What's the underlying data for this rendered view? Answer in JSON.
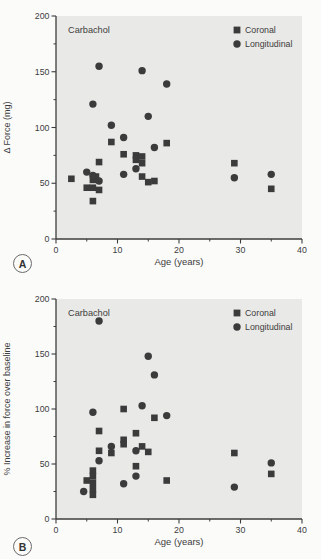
{
  "panels": [
    {
      "tag": "A"
    },
    {
      "tag": "B"
    }
  ],
  "colors": {
    "plot_bg": "#e9e9e7",
    "marker": "#3b3b3b",
    "axis": "#3d3d3d",
    "text": "#3d3d3d"
  },
  "chart_data": [
    {
      "type": "scatter",
      "title": "",
      "annotation": "Carbachol",
      "xlabel": "Age (years)",
      "ylabel": "Δ Force (mg)",
      "xlim": [
        0,
        40
      ],
      "ylim": [
        0,
        200
      ],
      "x_ticks": [
        0,
        10,
        20,
        30,
        40
      ],
      "x_minor_ticks": [
        5,
        15,
        25,
        35
      ],
      "y_ticks": [
        0,
        50,
        100,
        150,
        200
      ],
      "y_minor_ticks": [
        25,
        75,
        125,
        175
      ],
      "grid": false,
      "legend_position": "top-right",
      "series": [
        {
          "name": "Coronal",
          "marker": "square",
          "points": [
            [
              2.5,
              54
            ],
            [
              5,
              46
            ],
            [
              6,
              53
            ],
            [
              6,
              46
            ],
            [
              6,
              34
            ],
            [
              6.5,
              56
            ],
            [
              7,
              44
            ],
            [
              7,
              69
            ],
            [
              9,
              87
            ],
            [
              11,
              76
            ],
            [
              13,
              71
            ],
            [
              13,
              75
            ],
            [
              14,
              74
            ],
            [
              14,
              68
            ],
            [
              14,
              56
            ],
            [
              15,
              51
            ],
            [
              16,
              52
            ],
            [
              18,
              86
            ],
            [
              29,
              68
            ],
            [
              35,
              45
            ]
          ]
        },
        {
          "name": "Longitudinal",
          "marker": "circle",
          "points": [
            [
              5,
              60
            ],
            [
              6,
              57
            ],
            [
              6,
              121
            ],
            [
              7,
              155
            ],
            [
              7,
              52
            ],
            [
              9,
              102
            ],
            [
              11,
              91
            ],
            [
              11,
              58
            ],
            [
              13,
              63
            ],
            [
              14,
              151
            ],
            [
              15,
              110
            ],
            [
              16,
              82
            ],
            [
              18,
              139
            ],
            [
              29,
              55
            ],
            [
              35,
              58
            ]
          ]
        }
      ]
    },
    {
      "type": "scatter",
      "title": "",
      "annotation": "Carbachol",
      "xlabel": "Age (years)",
      "ylabel": "% Increase in force over baseline",
      "xlim": [
        0,
        40
      ],
      "ylim": [
        0,
        200
      ],
      "x_ticks": [
        0,
        10,
        20,
        30,
        40
      ],
      "x_minor_ticks": [
        5,
        15,
        25,
        35
      ],
      "y_ticks": [
        0,
        50,
        100,
        150,
        200
      ],
      "y_minor_ticks": [
        25,
        75,
        125,
        175
      ],
      "grid": false,
      "legend_position": "top-right",
      "series": [
        {
          "name": "Coronal",
          "marker": "square",
          "points": [
            [
              5,
              35
            ],
            [
              6,
              44
            ],
            [
              6,
              39
            ],
            [
              6,
              33
            ],
            [
              6,
              27
            ],
            [
              6,
              22
            ],
            [
              7,
              80
            ],
            [
              7,
              62
            ],
            [
              9,
              60
            ],
            [
              11,
              100
            ],
            [
              11,
              72
            ],
            [
              11,
              68
            ],
            [
              13,
              78
            ],
            [
              13,
              48
            ],
            [
              14,
              66
            ],
            [
              15,
              61
            ],
            [
              16,
              92
            ],
            [
              18,
              35
            ],
            [
              29,
              60
            ],
            [
              35,
              41
            ]
          ]
        },
        {
          "name": "Longitudinal",
          "marker": "circle",
          "points": [
            [
              4.5,
              25
            ],
            [
              6,
              97
            ],
            [
              7,
              180
            ],
            [
              7,
              53
            ],
            [
              9,
              66
            ],
            [
              11,
              32
            ],
            [
              13,
              62
            ],
            [
              13,
              39
            ],
            [
              14,
              103
            ],
            [
              15,
              148
            ],
            [
              16,
              131
            ],
            [
              18,
              94
            ],
            [
              29,
              29
            ],
            [
              35,
              51
            ]
          ]
        }
      ]
    }
  ]
}
